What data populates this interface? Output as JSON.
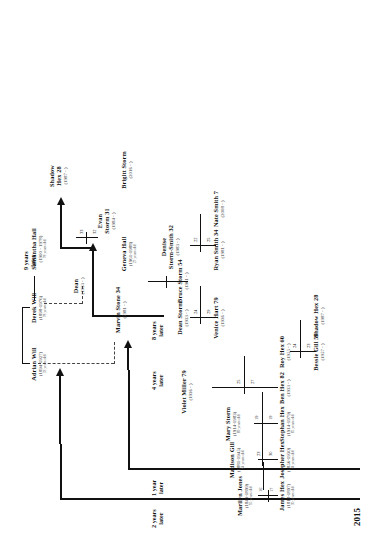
{
  "diagram": {
    "type": "family-tree-timeline",
    "year_label": "2015",
    "orientation": "rotated-90"
  },
  "time_labels": [
    {
      "id": "t2",
      "text_line1": "2 years",
      "text_line2": "later"
    },
    {
      "id": "t1",
      "text_line1": "1 year",
      "text_line2": "later"
    },
    {
      "id": "t4",
      "text_line1": "4 years",
      "text_line2": "later"
    },
    {
      "id": "t8",
      "text_line1": "8 years",
      "text_line2": "later"
    },
    {
      "id": "t9",
      "text_line1": "9 years",
      "text_line2": "later"
    }
  ],
  "people": [
    {
      "id": "james_hex",
      "name": "James Hex",
      "dates": "(1818-1897)",
      "age": "30 years old"
    },
    {
      "id": "marilyn_jones",
      "name": "Marilyn Jones",
      "dates": "(1843-1899)",
      "age": "55 years old"
    },
    {
      "id": "josepher_hex",
      "name": "Josepher Hex",
      "dates": "(1856-1930)",
      "age": "34 years old"
    },
    {
      "id": "madison_gill",
      "name": "Madison Gill",
      "dates": "(1881-1945)",
      "age": "64 years old"
    },
    {
      "id": "stephan_hex",
      "name": "Stephan Hex",
      "dates": "(1914-1979)",
      "age": "65 years old"
    },
    {
      "id": "mary_storm",
      "name": "Mary Storm",
      "dates": "(1914-1983)",
      "age": "69 years old"
    },
    {
      "id": "violet_miller",
      "name": "Violet Miller 79",
      "dates": "(1936 - )",
      "age": ""
    },
    {
      "id": "ben_hex",
      "name": "Ben Hex 82",
      "dates": "(1933 - )",
      "age": ""
    },
    {
      "id": "roy_hex",
      "name": "Roy Hex 60",
      "dates": "(1955 - )",
      "age": ""
    },
    {
      "id": "bessie_gill",
      "name": "Bessie Gill 58",
      "dates": "(1957 - )",
      "age": ""
    },
    {
      "id": "shadow_hex_28",
      "name": "Shadow Hex 28",
      "dates": "(1987 - )",
      "age": ""
    },
    {
      "id": "adrian_will",
      "name": "Adrian Will",
      "dates": "(1894-1927)",
      "age": "33 years old"
    },
    {
      "id": "derek_will",
      "name": "Derek Will",
      "dates": "(1898-1976)",
      "age": "78 years old"
    },
    {
      "id": "samantha_hall",
      "name": "Samantha Hall",
      "dates": "(1900 - 1978)",
      "age": "78 years old"
    },
    {
      "id": "marvin_stone",
      "name": "Marvin Stone 34",
      "dates": "(1981 - )",
      "age": ""
    },
    {
      "id": "dean_storm",
      "name": "Dean Storm",
      "dates": "(1933 - )",
      "age": ""
    },
    {
      "id": "dean",
      "name": "Dean",
      "dates": "(1933 - )",
      "age": ""
    },
    {
      "id": "venice_hart",
      "name": "Venice Hart 79",
      "dates": "(1936 - )",
      "age": ""
    },
    {
      "id": "bruce_storm",
      "name": "Bruce Storm 54",
      "dates": "(1961 - )",
      "age": ""
    },
    {
      "id": "geneva_hall",
      "name": "Geneva Hall",
      "dates": "(1961-1988)",
      "age": "27 years old"
    },
    {
      "id": "ryan_smith",
      "name": "Ryan Smith 34",
      "dates": "(1981 - )",
      "age": ""
    },
    {
      "id": "denise_ss",
      "name": "Denise",
      "name2": "Storm-Smith 32",
      "dates": "(1983 - )",
      "age": ""
    },
    {
      "id": "evan_storm",
      "name": "Evan",
      "name2": "Storm 31",
      "dates": "(1984 - )",
      "age": ""
    },
    {
      "id": "shadow_hex_r",
      "name": "Shadow",
      "name2": "Hex 28",
      "dates": "(1987 - )",
      "age": ""
    },
    {
      "id": "nate_smith",
      "name": "Nate Smith 7",
      "dates": "(2008 - )",
      "age": ""
    },
    {
      "id": "brigitt_storm",
      "name": "Brigitt Storm",
      "dates": "(2016 - )",
      "age": ""
    }
  ],
  "couple_numbers": [
    {
      "id": "n_james",
      "value": "17"
    },
    {
      "id": "n_marilyn",
      "value": "16"
    },
    {
      "id": "n_josepher",
      "value": "30"
    },
    {
      "id": "n_madison",
      "value": "23"
    },
    {
      "id": "n_stephan",
      "value": "19"
    },
    {
      "id": "n_mary",
      "value": "19"
    },
    {
      "id": "n_ben",
      "value": "27"
    },
    {
      "id": "n_violet",
      "value": "25"
    },
    {
      "id": "n_roy",
      "value": "23"
    },
    {
      "id": "n_bessie",
      "value": "24"
    },
    {
      "id": "n_bruce",
      "value": "24"
    },
    {
      "id": "n_venice",
      "value": "29"
    },
    {
      "id": "n_ryan",
      "value": "25"
    },
    {
      "id": "n_denise",
      "value": "22"
    },
    {
      "id": "n_evan",
      "value": "32"
    },
    {
      "id": "n_shadow",
      "value": "33"
    }
  ],
  "colors": {
    "line": "#111111",
    "text": "#1a1a1a",
    "background": "#ffffff"
  }
}
